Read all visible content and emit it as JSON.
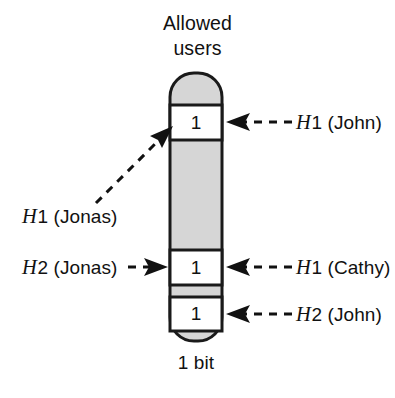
{
  "figure": {
    "title": {
      "line1": "Allowed",
      "line2": "users"
    },
    "footer_label": "1 bit",
    "bar": {
      "fill_color": "#d6d6d6",
      "stroke_color": "#1a1a1a",
      "cell_fill_color": "#ffffff",
      "cells": [
        {
          "value": "1",
          "name": "bit-cell-top"
        },
        {
          "value": "1",
          "name": "bit-cell-middle"
        },
        {
          "value": "1",
          "name": "bit-cell-bottom"
        }
      ]
    },
    "annotations": [
      {
        "id": "h1-john",
        "text_h": "H",
        "text_rest": "1 (John)",
        "side": "right"
      },
      {
        "id": "h1-cathy",
        "text_h": "H",
        "text_rest": "1 (Cathy)",
        "side": "right"
      },
      {
        "id": "h2-john",
        "text_h": "H",
        "text_rest": "2 (John)",
        "side": "right"
      },
      {
        "id": "h1-jonas",
        "text_h": "H",
        "text_rest": "1 (Jonas)",
        "side": "left"
      },
      {
        "id": "h2-jonas",
        "text_h": "H",
        "text_rest": "2 (Jonas)",
        "side": "left"
      }
    ]
  }
}
